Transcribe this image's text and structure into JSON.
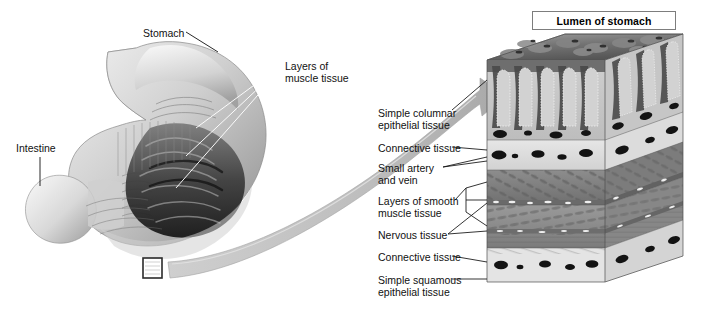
{
  "figure": {
    "type": "anatomical-diagram",
    "title_box": {
      "label": "Lumen of stomach"
    }
  },
  "left_illustration": {
    "name": "cutaway-stomach",
    "labels": [
      {
        "id": "stomach",
        "text": "Stomach",
        "x": 143,
        "y": 28
      },
      {
        "id": "intestine",
        "text": "Intestine",
        "x": 16,
        "y": 143
      },
      {
        "id": "muscle",
        "text": "Layers of\nmuscle tissue",
        "x": 285,
        "y": 61
      }
    ],
    "callout_square": {
      "x": 143,
      "y": 258,
      "w": 19,
      "h": 20
    }
  },
  "block_diagram": {
    "name": "tissue-block",
    "labels": [
      {
        "id": "simple-columnar",
        "text": "Simple columnar\nepithelial tissue",
        "x": 378,
        "y": 108
      },
      {
        "id": "connective-1",
        "text": "Connective tissue",
        "x": 378,
        "y": 143
      },
      {
        "id": "artery-vein",
        "text": "Small artery\nand vein",
        "x": 378,
        "y": 163
      },
      {
        "id": "smooth-muscle",
        "text": "Layers of smooth\nmuscle tissue",
        "x": 378,
        "y": 196
      },
      {
        "id": "nervous",
        "text": "Nervous tissue",
        "x": 378,
        "y": 230
      },
      {
        "id": "connective-2",
        "text": "Connective tissue",
        "x": 378,
        "y": 252
      },
      {
        "id": "simple-squamous",
        "text": "Simple squamous\nepithelial tissue",
        "x": 378,
        "y": 275
      }
    ],
    "layers": [
      {
        "id": "epithelium",
        "name": "Simple columnar epithelial tissue",
        "top": 60,
        "bottom": 140
      },
      {
        "id": "connective-up",
        "name": "Connective tissue",
        "top": 140,
        "bottom": 170
      },
      {
        "id": "muscle-outer",
        "name": "Smooth muscle layer (oblique)",
        "top": 170,
        "bottom": 205
      },
      {
        "id": "muscle-inner",
        "name": "Smooth muscle layer (circular)",
        "top": 205,
        "bottom": 248
      },
      {
        "id": "connective-lo",
        "name": "Connective tissue",
        "top": 248,
        "bottom": 282
      }
    ]
  },
  "colors": {
    "ink": "#111111",
    "box_border": "#7d7d7d",
    "arrow_fill": "#b9b9b9",
    "tissue_pale": "#d9d9d9",
    "tissue_mid": "#9a9a9a",
    "tissue_dark": "#4a4a4a",
    "vessel": "#1d1d1d",
    "leader": "#222222",
    "leader_light": "#ffffff"
  }
}
